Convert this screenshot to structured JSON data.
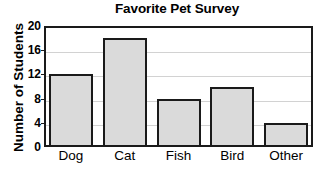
{
  "chart_data": {
    "type": "bar",
    "title": "Favorite Pet Survey",
    "xlabel": "",
    "ylabel": "Number of Students",
    "categories": [
      "Dog",
      "Cat",
      "Fish",
      "Bird",
      "Other"
    ],
    "values": [
      12,
      18,
      8,
      10,
      4
    ],
    "ylim": [
      0,
      20
    ],
    "yticks": [
      0,
      4,
      8,
      12,
      16,
      20
    ],
    "ytick_labels": [
      "0",
      "4",
      "8",
      "12",
      "16",
      "20"
    ],
    "grid": true,
    "legend": false,
    "legend_position": "none",
    "colors": {
      "bar_fill": "#dadada",
      "bar_edge": "#1a1a1a",
      "gridline": "#d2d2d2",
      "axis": "#1a1a1a",
      "text": "#000000",
      "background": "#ffffff"
    }
  }
}
